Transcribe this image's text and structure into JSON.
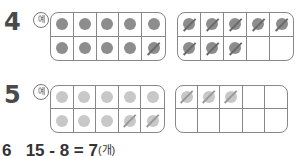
{
  "problems": [
    {
      "number": "4",
      "example_label": "예",
      "frames": [
        {
          "cells": [
            "dot",
            "dot",
            "dot",
            "dot",
            "dot",
            "dot",
            "dot",
            "dot",
            "dot",
            "dot-slash"
          ]
        },
        {
          "cells": [
            "dot-slash",
            "dot-slash",
            "dot-slash",
            "dot-slash",
            "dot-slash",
            "dot-slash",
            "dot-slash",
            "dot-slash",
            "empty",
            "empty"
          ]
        }
      ]
    },
    {
      "number": "5",
      "example_label": "예",
      "frames": [
        {
          "cells": [
            "dot",
            "dot",
            "dot",
            "dot",
            "dot",
            "dot",
            "dot",
            "dot",
            "dot-slash",
            "dot-slash"
          ]
        },
        {
          "cells": [
            "dot-slash",
            "dot-slash",
            "dot-slash",
            "empty",
            "empty",
            "empty",
            "empty",
            "empty",
            "empty",
            "empty"
          ]
        }
      ]
    }
  ],
  "answer6": {
    "number": "6",
    "expression": "15 - 8 = 7",
    "unit": "(개)"
  }
}
